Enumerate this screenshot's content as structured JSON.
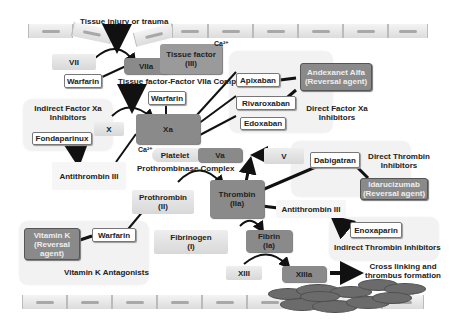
{
  "top_label": "Tissue injury or trauma",
  "calcium_label": "Ca²⁺",
  "factors": {
    "vii": "VII",
    "viia": "VIIa",
    "tissue_factor": [
      "Tissue factor",
      "(III)"
    ],
    "x": "X",
    "xa": "Xa",
    "v": "V",
    "va": "Va",
    "platelet": "Platelet",
    "prothrombin": [
      "Prothrombin",
      "(II)"
    ],
    "thrombin": [
      "Thrombin",
      "(IIa)"
    ],
    "fibrinogen": [
      "Fibrinogen",
      "(I)"
    ],
    "fibrin": [
      "Fibrin",
      "(Ia)"
    ],
    "xiii": "XIII",
    "xiiia": "XIIIa",
    "antithrombin_1": "Antithrombin III",
    "antithrombin_2": "Antithrombin III"
  },
  "complexes": {
    "tf_viia": "Tissue factor-Factor VIIa Complex",
    "prothrombinase": "Prothrombinase Complex"
  },
  "drugs": {
    "warfarin_1": "Warfarin",
    "warfarin_2": "Warfarin",
    "warfarin_3": "Warfarin",
    "apixaban": "Apixaban",
    "rivaroxaban": "Rivaroxaban",
    "edoxaban": "Edoxaban",
    "fondaparinux": "Fondaparinux",
    "dabigatran": "Dabigatran",
    "enoxaparin": "Enoxaparin"
  },
  "reversal_agents": {
    "andexanet": [
      "Andexanet Alfa",
      "(Reversal agent)"
    ],
    "idarucizumab": [
      "Idarucizumab",
      "(Reversal agent)"
    ],
    "vitamin_k": [
      "Vitamin K",
      "(Reversal",
      "agent)"
    ]
  },
  "panels": {
    "indirect_xa": [
      "Indirect Factor Xa",
      "Inhibitors"
    ],
    "direct_xa": [
      "Direct Factor Xa",
      "Inhibitors"
    ],
    "direct_thrombin": [
      "Direct Thrombin",
      "Inhibitors"
    ],
    "indirect_thrombin": "Indirect Thrombin Inhibitors",
    "vitamin_k_antagonists": "Vitamin K Antagonists"
  },
  "outcome": [
    "Cross linking and",
    "thrombus formation"
  ],
  "colors": {
    "active_factor": "#8a8a8a",
    "inactive_factor": "#e4e4e4",
    "panel": "#f2f2f2",
    "arrow": "#111111"
  }
}
